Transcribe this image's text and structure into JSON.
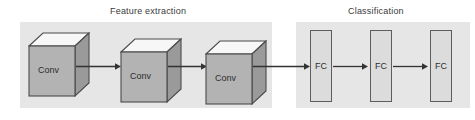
{
  "figure": {
    "type": "diagram",
    "background_color": "#ffffff",
    "panel_color": "#e6e6e6",
    "cube_front_color": "#b3b3b3",
    "cube_top_color": "#f7f7f7",
    "cube_side_color": "#9a9a9a",
    "fc_fill_color": "#dcdcdc",
    "stroke_color": "#4a4a4a",
    "text_color": "#2e2e2e"
  },
  "sections": [
    {
      "id": "feature-extraction",
      "title": "Feature extraction"
    },
    {
      "id": "classification",
      "title": "Classification"
    }
  ],
  "conv_blocks": [
    {
      "label": "Conv"
    },
    {
      "label": "Conv"
    },
    {
      "label": "Conv"
    }
  ],
  "fc_blocks": [
    {
      "label": "FC"
    },
    {
      "label": "FC"
    },
    {
      "label": "FC"
    }
  ],
  "arrows": [
    {
      "from": "conv-1",
      "to": "conv-2"
    },
    {
      "from": "conv-2",
      "to": "conv-3"
    },
    {
      "from": "conv-3",
      "to": "fc-1"
    },
    {
      "from": "fc-1",
      "to": "fc-2"
    },
    {
      "from": "fc-2",
      "to": "fc-3"
    }
  ]
}
